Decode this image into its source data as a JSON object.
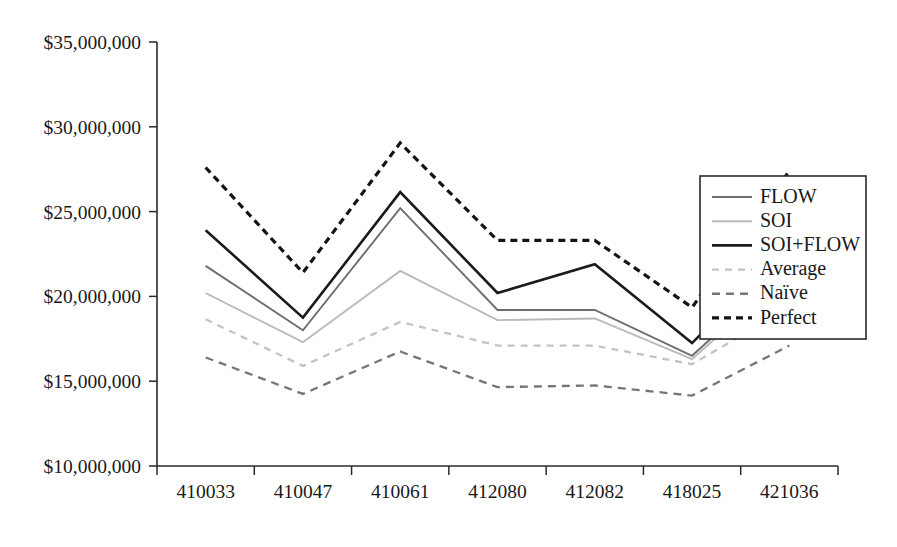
{
  "chart_data": {
    "type": "line",
    "title": "",
    "subtitle": "",
    "xlabel": "",
    "ylabel": "",
    "categories": [
      "410033",
      "410047",
      "410061",
      "412080",
      "412082",
      "418025",
      "421036"
    ],
    "ylim": [
      10000000,
      35000000
    ],
    "ytick_values": [
      10000000,
      15000000,
      20000000,
      25000000,
      30000000,
      35000000
    ],
    "ytick_labels": [
      "$10,000,000",
      "$15,000,000",
      "$20,000,000",
      "$25,000,000",
      "$30,000,000",
      "$35,000,000"
    ],
    "grid": false,
    "legend_position": "right",
    "series": [
      {
        "name": "FLOW",
        "values": [
          21800000,
          18000000,
          25200000,
          19200000,
          19200000,
          16500000,
          21700000
        ],
        "color": "#6e6e72",
        "width": 1.9,
        "dash": "none"
      },
      {
        "name": "SOI",
        "values": [
          20200000,
          17300000,
          21500000,
          18600000,
          18700000,
          16300000,
          21400000
        ],
        "color": "#b9b9bd",
        "width": 1.9,
        "dash": "none"
      },
      {
        "name": "SOI+FLOW",
        "values": [
          23900000,
          18750000,
          26150000,
          20200000,
          21900000,
          17250000,
          23050000
        ],
        "color": "#1b1b1d",
        "width": 2.6,
        "dash": "none"
      },
      {
        "name": "Average",
        "values": [
          18650000,
          15900000,
          18500000,
          17100000,
          17100000,
          16000000,
          19350000
        ],
        "color": "#c3c3c7",
        "width": 2.3,
        "dash": "7,6"
      },
      {
        "name": "Naïve",
        "values": [
          16400000,
          14250000,
          16750000,
          14650000,
          14750000,
          14150000,
          17100000
        ],
        "color": "#76767a",
        "width": 2.3,
        "dash": "8,6"
      },
      {
        "name": "Perfect",
        "values": [
          27600000,
          21400000,
          29050000,
          23300000,
          23300000,
          19350000,
          27400000
        ],
        "color": "#141416",
        "width": 3.2,
        "dash": "7,5"
      }
    ]
  },
  "legend": {
    "items": [
      {
        "label": "FLOW"
      },
      {
        "label": "SOI"
      },
      {
        "label": "SOI+FLOW"
      },
      {
        "label": "Average"
      },
      {
        "label": "Naïve"
      },
      {
        "label": "Perfect"
      }
    ]
  },
  "colors": {
    "axis": "#2a2a2c",
    "text": "#18181a",
    "background": "#ffffff"
  }
}
